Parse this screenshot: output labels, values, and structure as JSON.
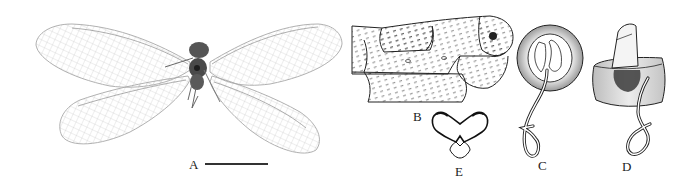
{
  "figure": {
    "panels": [
      {
        "id": "A",
        "label": "A",
        "content": "habitus photograph, dorsal view, wings spread",
        "has_scale_bar": true
      },
      {
        "id": "B",
        "label": "B",
        "content": "terminal abdominal segments, lateral view (line drawing)"
      },
      {
        "id": "C",
        "label": "C",
        "content": "spermatheca ring with coiled duct (line drawing)"
      },
      {
        "id": "D",
        "label": "D",
        "content": "spermatheca oblique view with coiled duct (line drawing)"
      },
      {
        "id": "E",
        "label": "E",
        "content": "subgenitale, ventral view (line drawing)"
      }
    ],
    "colors": {
      "background": "#ffffff",
      "ink": "#222222",
      "wing_vein": "#9a9a9a",
      "body": "#4a4a4a"
    }
  }
}
